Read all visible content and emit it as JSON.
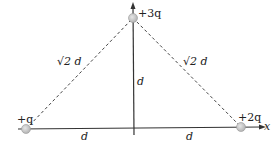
{
  "diagram": {
    "type": "charge-configuration",
    "charges": [
      {
        "id": "left",
        "label": "+q",
        "x": 26,
        "y": 129
      },
      {
        "id": "top",
        "label": "+3q",
        "x": 133,
        "y": 18
      },
      {
        "id": "right",
        "label": "+2q",
        "x": 241,
        "y": 127
      }
    ],
    "distances": {
      "left_diagonal": "√2 d",
      "right_diagonal": "√2 d",
      "vertical": "d",
      "left_base": "d",
      "right_base": "d"
    },
    "axes": {
      "x_label": "x",
      "y_label": "y"
    },
    "colors": {
      "line": "#333333",
      "charge_fill": "#c8c8c8",
      "charge_stroke": "#9a9a9a"
    }
  }
}
